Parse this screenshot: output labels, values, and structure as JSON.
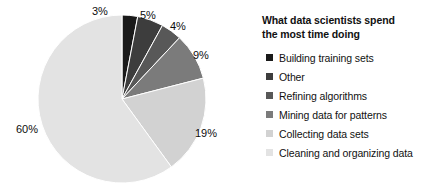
{
  "chart_data": {
    "type": "pie",
    "title": "What data scientists spend the most time doing",
    "title_line1": "What data scientists spend",
    "title_line2": "the most time doing",
    "categories": [
      "Building training sets",
      "Other",
      "Refining algorithms",
      "Mining data for patterns",
      "Collecting data sets",
      "Cleaning and organizing data"
    ],
    "values": [
      3,
      5,
      4,
      9,
      19,
      60
    ],
    "value_labels": [
      "3%",
      "5%",
      "4%",
      "9%",
      "19%",
      "60%"
    ],
    "colors": [
      "#1a1a1a",
      "#3d3d3d",
      "#585858",
      "#7b7b7b",
      "#d2d2d2",
      "#e3e3e3"
    ],
    "unit": "%",
    "start_angle_deg": 0,
    "direction": "clockwise",
    "legend_position": "right",
    "grid": false,
    "xlabel": "",
    "ylabel": ""
  },
  "label_positions": [
    {
      "text": "3%",
      "left": 92,
      "top": 6
    },
    {
      "text": "5%",
      "left": 140,
      "top": 10
    },
    {
      "text": "4%",
      "left": 170,
      "top": 21
    },
    {
      "text": "9%",
      "left": 193,
      "top": 50
    },
    {
      "text": "19%",
      "left": 195,
      "top": 128
    },
    {
      "text": "60%",
      "left": 16,
      "top": 124
    }
  ],
  "pie_geometry": {
    "cx": 122,
    "cy": 99,
    "r": 84
  }
}
